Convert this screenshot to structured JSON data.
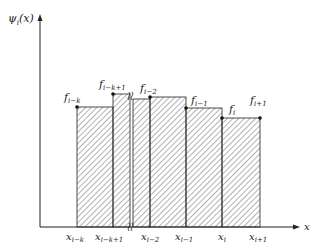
{
  "figure": {
    "y_axis_label": "ψ",
    "y_axis_label_sub": "i",
    "y_axis_label_arg": "(x)",
    "x_axis_label": "x",
    "point_labels": [
      {
        "base": "f",
        "sub": "i−k"
      },
      {
        "base": "f",
        "sub": "i−k+1"
      },
      {
        "base": "f",
        "sub": "i−2"
      },
      {
        "base": "f",
        "sub": "i−1"
      },
      {
        "base": "f",
        "sub": "i"
      },
      {
        "base": "f",
        "sub": "i+1"
      }
    ],
    "x_tick_labels": [
      {
        "base": "x",
        "sub": "i−k"
      },
      {
        "base": "x",
        "sub": "i−k+1"
      },
      {
        "base": "x",
        "sub": "i−2"
      },
      {
        "base": "x",
        "sub": "i−1"
      },
      {
        "base": "x",
        "sub": "i"
      },
      {
        "base": "x",
        "sub": "i+1"
      }
    ],
    "colors": {
      "line": "#222222",
      "hatch": "#555555"
    }
  }
}
